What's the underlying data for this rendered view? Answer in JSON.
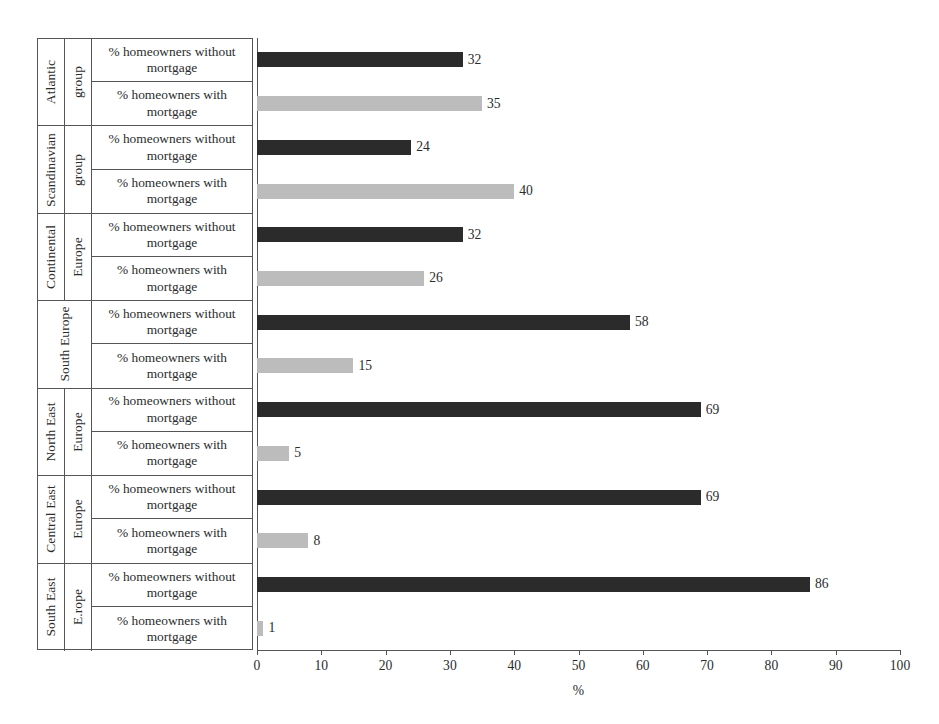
{
  "chart_data": {
    "type": "bar",
    "orientation": "horizontal",
    "title": "",
    "xlabel": "%",
    "ylabel": "",
    "xlim": [
      0,
      100
    ],
    "xticks": [
      0,
      10,
      20,
      30,
      40,
      50,
      60,
      70,
      80,
      90,
      100
    ],
    "grid": false,
    "legend": "none",
    "categories": [
      "Atlantic group",
      "Scandinavian group",
      "Continental Europe",
      "South Europe",
      "North East Europe",
      "Central East Europe",
      "South East E.rope"
    ],
    "series": [
      {
        "name": "% homeowners without mortgage",
        "color": "#2b2b2b",
        "values": [
          32,
          24,
          32,
          58,
          69,
          69,
          86
        ]
      },
      {
        "name": "% homeowners with mortgage",
        "color": "#bcbcbc",
        "values": [
          35,
          40,
          26,
          15,
          5,
          8,
          1
        ]
      }
    ]
  },
  "table": {
    "groups": [
      {
        "name_line1": "Atlantic",
        "name_line2": "group",
        "split": true,
        "rows": [
          {
            "label": "% homeowners without mortgage",
            "value": 32,
            "style": "dark"
          },
          {
            "label": "% homeowners with mortgage",
            "value": 35,
            "style": "light"
          }
        ]
      },
      {
        "name_line1": "Scandinavian",
        "name_line2": "group",
        "split": true,
        "rows": [
          {
            "label": "% homeowners without mortgage",
            "value": 24,
            "style": "dark"
          },
          {
            "label": "% homeowners with mortgage",
            "value": 40,
            "style": "light"
          }
        ]
      },
      {
        "name_line1": "Continental",
        "name_line2": "Europe",
        "split": true,
        "rows": [
          {
            "label": "% homeowners without mortgage",
            "value": 32,
            "style": "dark"
          },
          {
            "label": "% homeowners with mortgage",
            "value": 26,
            "style": "light"
          }
        ]
      },
      {
        "name_line1": "South Europe",
        "name_line2": "",
        "split": false,
        "rows": [
          {
            "label": "% homeowners without mortgage",
            "value": 58,
            "style": "dark"
          },
          {
            "label": "% homeowners with mortgage",
            "value": 15,
            "style": "light"
          }
        ]
      },
      {
        "name_line1": "North East",
        "name_line2": "Europe",
        "split": true,
        "rows": [
          {
            "label": "% homeowners without mortgage",
            "value": 69,
            "style": "dark"
          },
          {
            "label": "% homeowners with mortgage",
            "value": 5,
            "style": "light"
          }
        ]
      },
      {
        "name_line1": "Central East",
        "name_line2": "Europe",
        "split": true,
        "rows": [
          {
            "label": "% homeowners without mortgage",
            "value": 69,
            "style": "dark"
          },
          {
            "label": "% homeowners with mortgage",
            "value": 8,
            "style": "light"
          }
        ]
      },
      {
        "name_line1": "South East",
        "name_line2": "E.rope",
        "split": true,
        "rows": [
          {
            "label": "% homeowners without mortgage",
            "value": 86,
            "style": "dark"
          },
          {
            "label": "% homeowners with mortgage",
            "value": 1,
            "style": "light"
          }
        ]
      }
    ]
  },
  "axis": {
    "title": "%",
    "ticks": [
      "0",
      "10",
      "20",
      "30",
      "40",
      "50",
      "60",
      "70",
      "80",
      "90",
      "100"
    ]
  },
  "colors": {
    "bar_without_mortgage": "#2b2b2b",
    "bar_with_mortgage": "#bcbcbc",
    "line": "#555555",
    "text": "#2b2b2b",
    "background": "#ffffff"
  }
}
